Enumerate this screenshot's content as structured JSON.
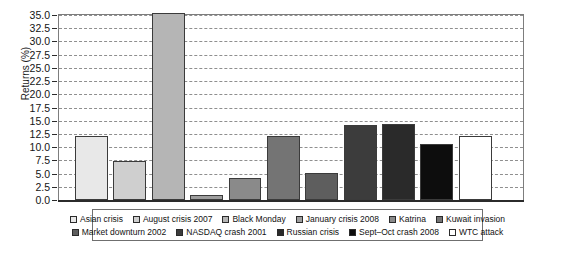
{
  "chart_data": {
    "type": "bar",
    "title": "",
    "xlabel": "",
    "ylabel": "Returns (%)",
    "ylim": [
      0,
      35
    ],
    "ytick_step": 2.5,
    "yticks": [
      "35.0",
      "32.5",
      "30.0",
      "27.5",
      "25.0",
      "22.5",
      "20.0",
      "17.5",
      "15.0",
      "12.5",
      "10.0",
      "7.5",
      "5.0",
      "2.5",
      "0.0"
    ],
    "grid": true,
    "legend_position": "bottom",
    "categories": [
      "Asian crisis",
      "August crisis 2007",
      "Black Monday",
      "January crisis 2008",
      "Katrina",
      "Kuwait invasion",
      "Market downturn 2002",
      "NASDAQ crash 2001",
      "Russian crisis",
      "Sept–Oct crash 2008",
      "WTC attack"
    ],
    "values": [
      12.2,
      7.4,
      35.3,
      1.0,
      4.1,
      12.1,
      5.1,
      14.2,
      14.3,
      10.6,
      12.1
    ],
    "colors": [
      "#e8e8e8",
      "#cfcfcf",
      "#b5b5b5",
      "#9e9e9e",
      "#8a8a8a",
      "#747474",
      "#5e5e5e",
      "#3c3c3c",
      "#2a2a2a",
      "#0d0d0d",
      "#ffffff"
    ]
  },
  "legend": {
    "row1": [
      {
        "label": "Asian crisis",
        "color": "#e8e8e8"
      },
      {
        "label": "August crisis 2007",
        "color": "#cfcfcf"
      },
      {
        "label": "Black Monday",
        "color": "#b5b5b5"
      },
      {
        "label": "January crisis 2008",
        "color": "#9e9e9e"
      },
      {
        "label": "Katrina",
        "color": "#8a8a8a"
      },
      {
        "label": "Kuwait invasion",
        "color": "#747474"
      }
    ],
    "row2": [
      {
        "label": "Market downturn 2002",
        "color": "#5e5e5e"
      },
      {
        "label": "NASDAQ crash 2001",
        "color": "#3c3c3c"
      },
      {
        "label": "Russian crisis",
        "color": "#2a2a2a"
      },
      {
        "label": "Sept–Oct crash 2008",
        "color": "#0d0d0d"
      },
      {
        "label": "WTC attack",
        "color": "#ffffff"
      }
    ]
  }
}
